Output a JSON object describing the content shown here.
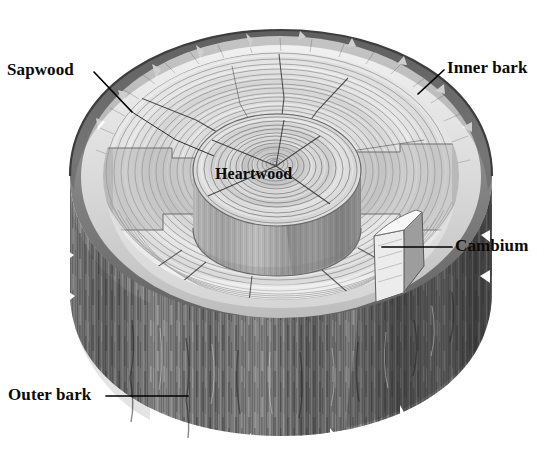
{
  "figure": {
    "background_color": "#ffffff",
    "line_color": "#000000",
    "text_color": "#0a0a0a"
  },
  "labels": {
    "sapwood": "Sapwood",
    "inner_bark": "Inner bark",
    "cambium": "Cambium",
    "outer_bark": "Outer bark",
    "heartwood": "Heartwood"
  },
  "palette": {
    "outer_bark_dark": "#4f4f4f",
    "outer_bark_mid": "#777777",
    "outer_bark_light": "#9a9a9a",
    "bark_rim_dark": "#6e6e6e",
    "bark_rim_mid": "#8c8c8c",
    "sapwood_light": "#ededed",
    "sapwood_mid": "#d9d9d9",
    "heartwood_mid": "#c9c9c9",
    "heartwood_dark": "#a8a8a8",
    "cambium_pale": "#f4f4f4",
    "shadow": "#8f8f8f"
  },
  "structure": {
    "layers": [
      "Outer bark",
      "Inner bark",
      "Cambium",
      "Sapwood",
      "Heartwood"
    ],
    "growth_ring_count_visible": 34,
    "radial_crack_count": 9,
    "view": "cut-away perspective of log showing stepped terraces"
  }
}
